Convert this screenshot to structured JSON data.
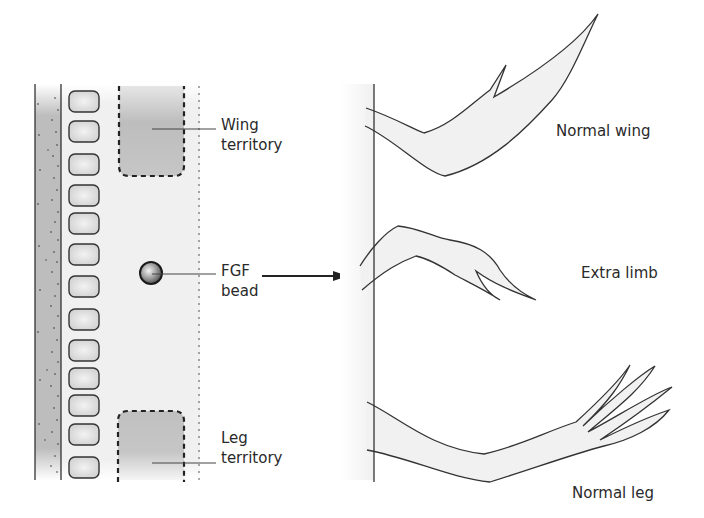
{
  "labels": {
    "wing_territory": [
      "Wing",
      "territory"
    ],
    "fgf_bead": [
      "FGF",
      "bead"
    ],
    "leg_territory": [
      "Leg",
      "territory"
    ],
    "normal_wing": "Normal wing",
    "extra_limb": "Extra limb",
    "normal_leg": "Normal leg"
  },
  "embryo": {
    "somite_count": 13
  },
  "colors": {
    "line": "#333333",
    "shading": "#c8c8c8",
    "limb_fill": "#f1f1f1"
  }
}
